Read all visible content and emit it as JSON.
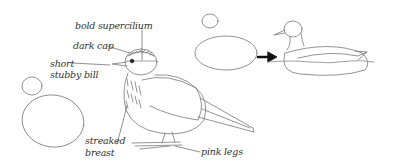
{
  "figure": {
    "bird": {
      "labels": {
        "bold_supercilium": "bold supercilium",
        "dark_cap": "dark cap",
        "short_bill_line1": "short",
        "short_bill_line2": "stubby bill",
        "streaked_line1": "streaked",
        "streaked_line2": "breast",
        "pink_legs": "pink legs"
      }
    },
    "duck_sequence": {
      "arrow": "right-arrow"
    },
    "colors": {
      "stroke": "#777777",
      "text": "#333333",
      "arrow": "#111111"
    }
  }
}
